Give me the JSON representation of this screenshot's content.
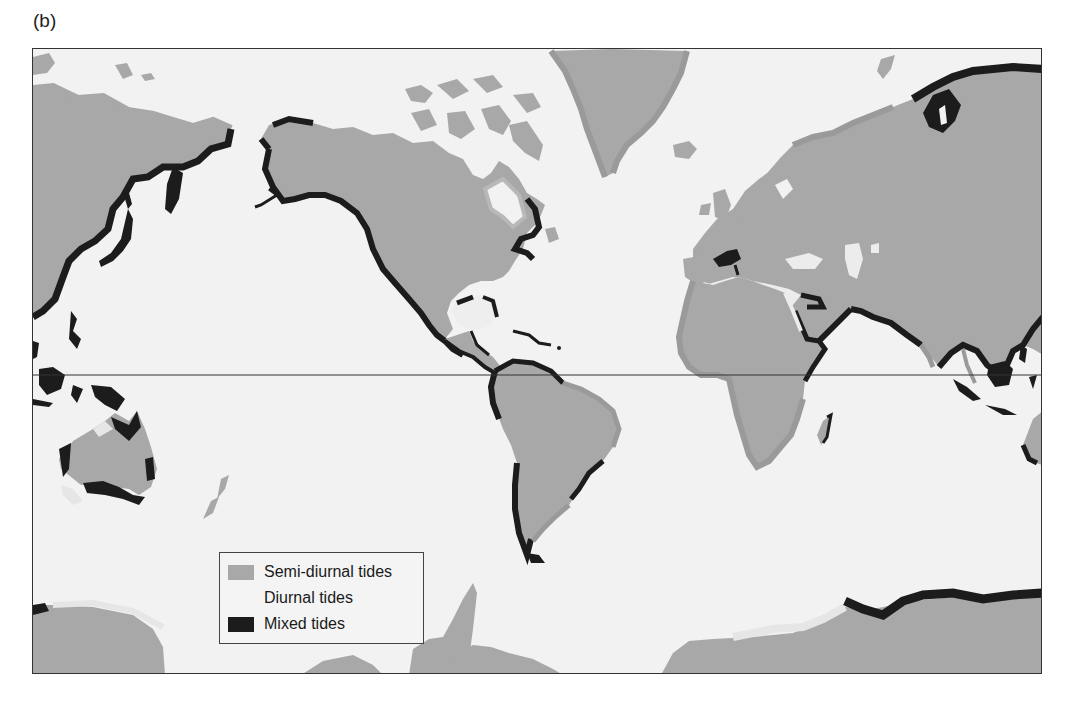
{
  "panel_label": "(b)",
  "map": {
    "title": "World distribution of tide types",
    "projection": "Mercator-style world map",
    "equator_line": true,
    "colors": {
      "ocean": "#f2f2f2",
      "semi_diurnal": "#a8a8a8",
      "diurnal": "#e6e6e6",
      "mixed": "#1c1c1c",
      "frame": "#333333"
    },
    "regions": {
      "semi_diurnal": [
        "Atlantic coasts of Europe and Africa",
        "Greenland",
        "Arctic Canada",
        "Arctic Siberia",
        "Eastern South America",
        "Indian subcontinent (west)",
        "Eastern Australia (part)",
        "Antarctica (Atlantic sector)"
      ],
      "diurnal": [
        "Gulf of Mexico",
        "Black Sea / Caspian",
        "Western Australia (part)",
        "Antarctic coast segments",
        "Hudson Bay",
        "Mediterranean (part)"
      ],
      "mixed": [
        "Pacific coast of North America",
        "Alaska",
        "Pacific coast of South America",
        "East Asian coast",
        "Sea of Okhotsk",
        "Indonesia",
        "Northern Australia",
        "Southern Australia",
        "Arabian Sea / Red Sea mouth",
        "Bay of Bengal",
        "Caribbean coasts",
        "Eastern Canada",
        "Madagascar (east)",
        "East Antarctica (Indian Ocean sector)",
        "Northeast Siberia"
      ]
    }
  },
  "legend": {
    "items": [
      {
        "label": "Semi-diurnal tides",
        "color": "#a8a8a8"
      },
      {
        "label": "Diurnal tides",
        "color": "#f4f4f4"
      },
      {
        "label": "Mixed tides",
        "color": "#1c1c1c"
      }
    ]
  }
}
